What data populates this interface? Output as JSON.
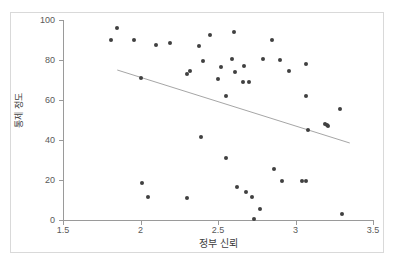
{
  "chart_data": {
    "type": "scatter",
    "title": "",
    "xlabel": "정부 신뢰",
    "ylabel": "통제 정도",
    "xlim": [
      1.5,
      3.5
    ],
    "ylim": [
      0,
      100
    ],
    "xticks": [
      1.5,
      2,
      2.5,
      3,
      3.5
    ],
    "xtick_labels": [
      "1.5",
      "2",
      "2.5",
      "3",
      "3.5"
    ],
    "yticks": [
      0,
      20,
      40,
      60,
      80,
      100
    ],
    "ytick_labels": [
      "0",
      "20",
      "40",
      "60",
      "80",
      "100"
    ],
    "grid": false,
    "legend": null,
    "marker_color": "#404040",
    "trendline_color": "#a6a6a6",
    "axis_color": "#9a9a9a",
    "frame_color": "#d9d9d9",
    "points": [
      {
        "x": 1.81,
        "y": 89.8
      },
      {
        "x": 1.85,
        "y": 95.8
      },
      {
        "x": 1.96,
        "y": 89.8
      },
      {
        "x": 2.0,
        "y": 70.8
      },
      {
        "x": 2.01,
        "y": 18.7
      },
      {
        "x": 2.05,
        "y": 11.3
      },
      {
        "x": 2.1,
        "y": 87.6
      },
      {
        "x": 2.19,
        "y": 88.7
      },
      {
        "x": 2.3,
        "y": 73.2
      },
      {
        "x": 2.3,
        "y": 11.2
      },
      {
        "x": 2.32,
        "y": 74.3
      },
      {
        "x": 2.38,
        "y": 86.8
      },
      {
        "x": 2.39,
        "y": 41.4
      },
      {
        "x": 2.4,
        "y": 79.4
      },
      {
        "x": 2.45,
        "y": 92.5
      },
      {
        "x": 2.5,
        "y": 70.3
      },
      {
        "x": 2.52,
        "y": 76.5
      },
      {
        "x": 2.55,
        "y": 61.8
      },
      {
        "x": 2.55,
        "y": 31.2
      },
      {
        "x": 2.59,
        "y": 80.4
      },
      {
        "x": 2.6,
        "y": 93.9
      },
      {
        "x": 2.61,
        "y": 73.9
      },
      {
        "x": 2.62,
        "y": 16.6
      },
      {
        "x": 2.66,
        "y": 68.8
      },
      {
        "x": 2.67,
        "y": 76.8
      },
      {
        "x": 2.68,
        "y": 13.8
      },
      {
        "x": 2.7,
        "y": 68.8
      },
      {
        "x": 2.72,
        "y": 11.3
      },
      {
        "x": 2.73,
        "y": 0.3
      },
      {
        "x": 2.77,
        "y": 5.7
      },
      {
        "x": 2.79,
        "y": 80.4
      },
      {
        "x": 2.85,
        "y": 89.8
      },
      {
        "x": 2.86,
        "y": 25.6
      },
      {
        "x": 2.9,
        "y": 80.0
      },
      {
        "x": 2.91,
        "y": 19.4
      },
      {
        "x": 2.96,
        "y": 74.3
      },
      {
        "x": 3.04,
        "y": 19.3
      },
      {
        "x": 3.07,
        "y": 19.3
      },
      {
        "x": 3.07,
        "y": 77.8
      },
      {
        "x": 3.07,
        "y": 62.1
      },
      {
        "x": 3.08,
        "y": 45.1
      },
      {
        "x": 3.19,
        "y": 48.0
      },
      {
        "x": 3.2,
        "y": 47.4
      },
      {
        "x": 3.21,
        "y": 47.0
      },
      {
        "x": 3.29,
        "y": 55.3
      },
      {
        "x": 3.3,
        "y": 2.9
      }
    ],
    "trendline": {
      "x_start": 1.85,
      "y_start": 75.0,
      "x_end": 3.35,
      "y_end": 38.5
    }
  }
}
